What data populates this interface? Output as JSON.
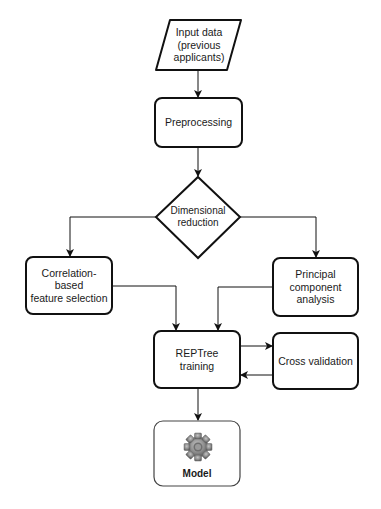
{
  "diagram": {
    "type": "flowchart",
    "nodes": [
      {
        "id": "input",
        "shape": "parallelogram",
        "label": "Input data (previous applicants)",
        "lines": [
          "Input data",
          "(previous",
          "applicants)"
        ]
      },
      {
        "id": "preprocessing",
        "shape": "rounded-rect",
        "label": "Preprocessing"
      },
      {
        "id": "dimred",
        "shape": "diamond",
        "label": "Dimensional reduction",
        "lines": [
          "Dimensional",
          "reduction"
        ]
      },
      {
        "id": "cfs",
        "shape": "rounded-rect",
        "label": "Correlation-based feature selection",
        "lines": [
          "Correlation-",
          "based",
          "feature selection"
        ]
      },
      {
        "id": "pca",
        "shape": "rounded-rect",
        "label": "Principal component analysis",
        "lines": [
          "Principal",
          "component",
          "analysis"
        ]
      },
      {
        "id": "reptree",
        "shape": "rounded-rect",
        "label": "REPTree training",
        "lines": [
          "REPTree",
          "training"
        ]
      },
      {
        "id": "cv",
        "shape": "rounded-rect",
        "label": "Cross validation"
      },
      {
        "id": "model",
        "shape": "rounded-rect",
        "label": "Model",
        "icon": "gear-icon"
      }
    ],
    "edges": [
      {
        "from": "input",
        "to": "preprocessing"
      },
      {
        "from": "preprocessing",
        "to": "dimred"
      },
      {
        "from": "dimred",
        "to": "cfs"
      },
      {
        "from": "dimred",
        "to": "pca"
      },
      {
        "from": "cfs",
        "to": "reptree"
      },
      {
        "from": "pca",
        "to": "reptree"
      },
      {
        "from": "reptree",
        "to": "cv"
      },
      {
        "from": "cv",
        "to": "reptree"
      },
      {
        "from": "reptree",
        "to": "model"
      }
    ],
    "colors": {
      "stroke": "#111111",
      "model_stroke": "#444444",
      "gear": "#8a8a8a"
    }
  }
}
